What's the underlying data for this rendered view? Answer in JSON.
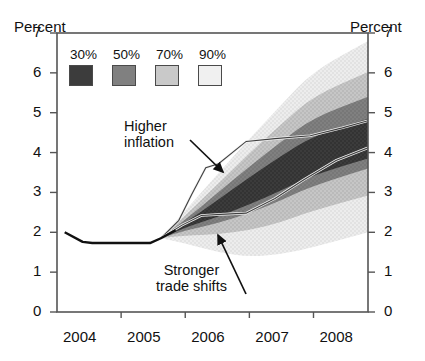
{
  "chart_data": {
    "type": "area",
    "title": "",
    "subtitle": "",
    "xlabel": "",
    "ylabel": "Percent",
    "y_right_label": "Percent",
    "ylim": [
      0,
      7
    ],
    "xlim": [
      2004.0,
      2008.85
    ],
    "yticks": [
      0,
      1,
      2,
      3,
      4,
      5,
      6,
      7
    ],
    "ytick_labels": [
      "0",
      "1",
      "2",
      "3",
      "4",
      "5",
      "6",
      "7"
    ],
    "xticks": [
      2004.0,
      2005.0,
      2006.0,
      2007.0,
      2008.0
    ],
    "xtick_labels": [
      "2004",
      "2005",
      "2006",
      "2007",
      "2008"
    ],
    "grid": false,
    "legend_position": "top-left",
    "legend": [
      {
        "label": "30%",
        "color": "#3a3a3a"
      },
      {
        "label": "50%",
        "color": "#7b7b7b"
      },
      {
        "label": "70%",
        "color": "#c2c2c2"
      },
      {
        "label": "90%",
        "color": "#ececec"
      }
    ],
    "fan_start_x": 2005.62,
    "fan_start_y": 1.85,
    "x": [
      2005.62,
      2006.0,
      2006.5,
      2007.0,
      2007.5,
      2008.0,
      2008.85
    ],
    "bands": [
      {
        "name": "90%",
        "color": "#ececec",
        "upper": [
          1.85,
          2.55,
          3.45,
          4.35,
          5.2,
          6.05,
          6.8
        ],
        "lower": [
          1.85,
          1.72,
          1.5,
          1.38,
          1.45,
          1.62,
          2.0
        ]
      },
      {
        "name": "70%",
        "color": "#c2c2c2",
        "upper": [
          1.85,
          2.42,
          3.2,
          3.98,
          4.72,
          5.42,
          6.02
        ],
        "lower": [
          1.85,
          1.92,
          1.95,
          2.05,
          2.25,
          2.55,
          2.92
        ]
      },
      {
        "name": "50%",
        "color": "#7b7b7b",
        "upper": [
          1.85,
          2.32,
          2.98,
          3.65,
          4.28,
          4.88,
          5.4
        ],
        "lower": [
          1.85,
          2.05,
          2.22,
          2.48,
          2.8,
          3.18,
          3.6
        ]
      },
      {
        "name": "30%",
        "color": "#3a3a3a",
        "upper": [
          1.85,
          2.24,
          2.8,
          3.38,
          3.92,
          4.42,
          4.85
        ],
        "lower": [
          1.85,
          2.12,
          2.38,
          2.7,
          3.05,
          3.45,
          3.85
        ]
      }
    ],
    "series": [
      {
        "name": "History",
        "style": "solid-black",
        "x": [
          2004.12,
          2004.4,
          2004.55,
          2005.45,
          2005.62,
          2005.85
        ],
        "values": [
          2.0,
          1.76,
          1.73,
          1.73,
          1.85,
          2.05
        ]
      },
      {
        "name": "Higher inflation",
        "style": "thin-outline",
        "x": [
          2005.62,
          2005.9,
          2006.1,
          2006.32,
          2006.52,
          2006.95,
          2007.4,
          2007.95,
          2008.45,
          2008.85
        ],
        "values": [
          1.85,
          2.3,
          2.95,
          3.62,
          3.72,
          4.28,
          4.35,
          4.42,
          4.62,
          4.8
        ]
      },
      {
        "name": "Stronger trade shifts",
        "style": "thin-outline",
        "x": [
          2005.62,
          2005.95,
          2006.25,
          2006.55,
          2006.95,
          2007.4,
          2007.85,
          2008.35,
          2008.85
        ],
        "values": [
          1.85,
          2.18,
          2.42,
          2.45,
          2.48,
          2.85,
          3.32,
          3.8,
          4.12
        ]
      }
    ],
    "annotations": [
      {
        "name": "higher-inflation",
        "text_line1": "Higher",
        "text_line2": "inflation",
        "text": "Higher inflation",
        "label_x_px": 124,
        "label_y_px": 118,
        "arrow_from": [
          190,
          140
        ],
        "arrow_to": [
          223,
          172
        ]
      },
      {
        "name": "stronger-trade-shifts",
        "text_line1": "Stronger",
        "text_line2": "trade shifts",
        "text": "Stronger trade shifts",
        "label_x_px": 156,
        "label_y_px": 265,
        "arrow_from": [
          246,
          294
        ],
        "arrow_to": [
          218,
          235
        ]
      }
    ]
  },
  "axes": {
    "left_title": "Percent",
    "right_title": "Percent"
  }
}
